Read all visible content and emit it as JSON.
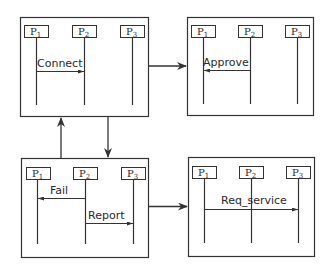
{
  "diagram": {
    "type": "state-transition of message sequence charts",
    "colors": {
      "stroke": "#333333",
      "background": "#ffffff"
    },
    "states": [
      {
        "id": "s1",
        "processes": [
          {
            "name": "P",
            "sub": "1"
          },
          {
            "name": "P",
            "sub": "2"
          },
          {
            "name": "P",
            "sub": "3"
          }
        ],
        "messages": [
          {
            "label": "Connect",
            "from": "P1",
            "to": "P2"
          }
        ]
      },
      {
        "id": "s2",
        "processes": [
          {
            "name": "P",
            "sub": "1"
          },
          {
            "name": "P",
            "sub": "2"
          },
          {
            "name": "P",
            "sub": "3"
          }
        ],
        "messages": [
          {
            "label": "Approve",
            "from": "P2",
            "to": "P1"
          }
        ]
      },
      {
        "id": "s3",
        "processes": [
          {
            "name": "P",
            "sub": "1"
          },
          {
            "name": "P",
            "sub": "2"
          },
          {
            "name": "P",
            "sub": "3"
          }
        ],
        "messages": [
          {
            "label": "Fail",
            "from": "P2",
            "to": "P1"
          },
          {
            "label": "Report",
            "from": "P2",
            "to": "P3"
          }
        ]
      },
      {
        "id": "s4",
        "processes": [
          {
            "name": "P",
            "sub": "1"
          },
          {
            "name": "P",
            "sub": "2"
          },
          {
            "name": "P",
            "sub": "3"
          }
        ],
        "messages": [
          {
            "label": "Req_service",
            "from": "P1",
            "to": "P3"
          }
        ]
      }
    ],
    "transitions": [
      {
        "from": "s1",
        "to": "s2"
      },
      {
        "from": "s1",
        "to": "s3"
      },
      {
        "from": "s3",
        "to": "s1"
      },
      {
        "from": "s3",
        "to": "s4"
      }
    ]
  }
}
